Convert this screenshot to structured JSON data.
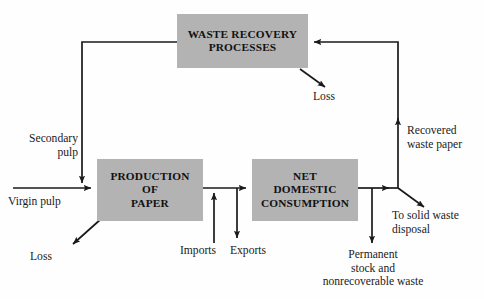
{
  "figure": {
    "type": "flow-diagram",
    "width": 484,
    "height": 299,
    "background": "#ffffff",
    "box_fill": "#b3b3b3",
    "line_color": "#1a1a1a",
    "text_color": "#111111",
    "corner_mark": ""
  },
  "nodes": [
    {
      "id": "waste-recovery",
      "label": "WASTE RECOVERY\nPROCESSES"
    },
    {
      "id": "production",
      "label": "PRODUCTION\nOF\nPAPER"
    },
    {
      "id": "consumption",
      "label": "NET\nDOMESTIC\nCONSUMPTION"
    }
  ],
  "labels": {
    "secondary_pulp": "Secondary\npulp",
    "virgin_pulp": "Virgin pulp",
    "loss_production": "Loss",
    "loss_waste_recovery": "Loss",
    "imports": "Imports",
    "exports": "Exports",
    "permanent_stock": "Permanent\nstock and\nnonrecoverable waste",
    "recovered_waste_paper": "Recovered\nwaste paper",
    "solid_waste_disposal": "To solid waste\ndisposal"
  },
  "edges": [
    {
      "id": "virgin-pulp-in",
      "from": "external",
      "to": "production",
      "label": "Virgin pulp",
      "direction": "right"
    },
    {
      "id": "secondary-pulp-in",
      "from": "waste-recovery",
      "to": "production",
      "label": "Secondary pulp",
      "direction": "down"
    },
    {
      "id": "production-loss",
      "from": "production",
      "to": "external",
      "label": "Loss",
      "direction": "down-left"
    },
    {
      "id": "imports-in",
      "from": "external",
      "to": "consumption",
      "label": "Imports",
      "direction": "up"
    },
    {
      "id": "exports-out",
      "from": "production",
      "to": "external",
      "label": "Exports",
      "direction": "down"
    },
    {
      "id": "production-to-consumption",
      "from": "production",
      "to": "consumption",
      "label": "",
      "direction": "right"
    },
    {
      "id": "permanent-stock-out",
      "from": "consumption",
      "to": "external",
      "label": "Permanent stock and nonrecoverable waste",
      "direction": "down"
    },
    {
      "id": "solid-waste-out",
      "from": "consumption",
      "to": "external",
      "label": "To solid waste disposal",
      "direction": "down-right"
    },
    {
      "id": "recovered-waste-paper",
      "from": "consumption",
      "to": "waste-recovery",
      "label": "Recovered waste paper",
      "direction": "up-then-left"
    },
    {
      "id": "waste-recovery-loss",
      "from": "waste-recovery",
      "to": "external",
      "label": "Loss",
      "direction": "down-right"
    }
  ]
}
